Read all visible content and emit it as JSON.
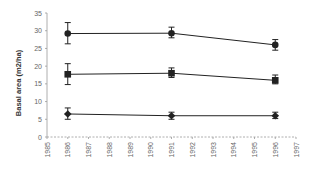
{
  "chart_data": {
    "type": "line",
    "title": "",
    "xlabel": "",
    "ylabel": "Basal area (m2/ha)",
    "ylim": [
      0,
      35
    ],
    "xlim": [
      1985,
      1997
    ],
    "yticks": [
      0,
      5,
      10,
      15,
      20,
      25,
      30,
      35
    ],
    "xticks": [
      1985,
      1986,
      1987,
      1988,
      1989,
      1990,
      1991,
      1992,
      1993,
      1994,
      1995,
      1996,
      1997
    ],
    "grid": false,
    "legend": null,
    "x": [
      1986,
      1991,
      1996
    ],
    "series": [
      {
        "name": "series-1",
        "marker": "circle",
        "values": [
          29.2,
          29.3,
          26.0
        ],
        "error_low": [
          26.3,
          28.0,
          24.5
        ],
        "error_high": [
          32.3,
          31.0,
          27.5
        ]
      },
      {
        "name": "series-2",
        "marker": "square",
        "values": [
          17.7,
          18.0,
          16.0
        ],
        "error_low": [
          14.8,
          16.8,
          15.0
        ],
        "error_high": [
          20.7,
          19.5,
          17.5
        ]
      },
      {
        "name": "series-3",
        "marker": "diamond",
        "values": [
          6.5,
          6.0,
          6.0
        ],
        "error_low": [
          5.0,
          5.0,
          5.2
        ],
        "error_high": [
          8.2,
          7.0,
          7.0
        ]
      }
    ],
    "colors": {
      "line": "#222222",
      "axis": "#999999",
      "tick_label": "#666666"
    }
  }
}
